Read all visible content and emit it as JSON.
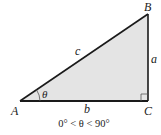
{
  "diagram": {
    "vertices": {
      "A": "A",
      "B": "B",
      "C": "C"
    },
    "sides": {
      "a": "a",
      "b": "b",
      "c": "c"
    },
    "angle": "θ",
    "caption": "0° < θ < 90°",
    "colors": {
      "fill": "#e4e4e4",
      "stroke": "#1a1a1a",
      "text": "#222222"
    }
  }
}
